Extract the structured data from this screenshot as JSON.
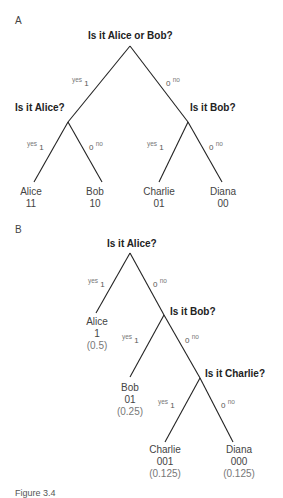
{
  "panel_a": {
    "label": "A",
    "root_question": "Is it Alice or Bob?",
    "left_question": "Is it Alice?",
    "right_question": "Is it Bob?",
    "edge_yes_label": "yes",
    "edge_no_label": "no",
    "bit_one": "1",
    "bit_zero": "0",
    "leaves": [
      {
        "name": "Alice",
        "code": "11"
      },
      {
        "name": "Bob",
        "code": "10"
      },
      {
        "name": "Charlie",
        "code": "01"
      },
      {
        "name": "Diana",
        "code": "00"
      }
    ]
  },
  "panel_b": {
    "label": "B",
    "q1": "Is it Alice?",
    "q2": "Is it Bob?",
    "q3": "Is it Charlie?",
    "edge_yes_label": "yes",
    "edge_no_label": "no",
    "bit_one": "1",
    "bit_zero": "0",
    "leaves": [
      {
        "name": "Alice",
        "code": "1",
        "prob": "(0.5)"
      },
      {
        "name": "Bob",
        "code": "01",
        "prob": "(0.25)"
      },
      {
        "name": "Charlie",
        "code": "001",
        "prob": "(0.125)"
      },
      {
        "name": "Diana",
        "code": "000",
        "prob": "(0.125)"
      }
    ]
  },
  "caption": "Figure 3.4",
  "colors": {
    "line": "#222222",
    "text": "#444444",
    "secondary": "#777777"
  }
}
